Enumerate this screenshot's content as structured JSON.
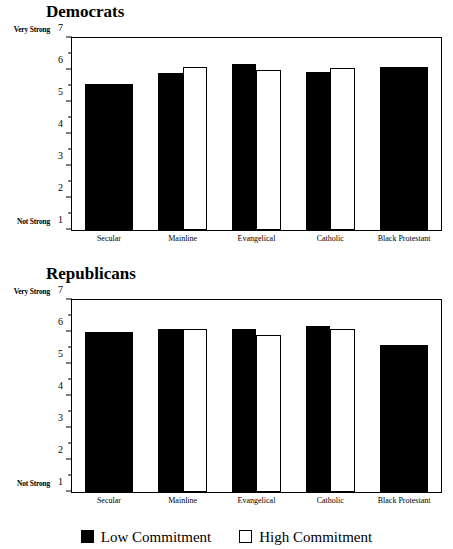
{
  "figure": {
    "axis_min": 1,
    "axis_max": 7,
    "y_axis_label": "Strength of Party Support",
    "y_low_anchor": "Not Strong",
    "y_high_anchor": "Very Strong",
    "tick_labels": [
      "7",
      "6",
      "5",
      "4",
      "3",
      "2",
      "1"
    ],
    "tick_values": [
      7,
      6,
      5,
      4,
      3,
      2,
      1
    ],
    "minor_tick_values": [
      6.5,
      5.5,
      4.5,
      3.5,
      2.5,
      1.5
    ],
    "categories": [
      "Secular",
      "Mainline",
      "Evangelical",
      "Catholic",
      "Black Protestant"
    ],
    "series_names": [
      "Low Commitment",
      "High Commitment"
    ],
    "colors": {
      "low_commitment": "#000000",
      "high_commitment": "#ffffff",
      "outline": "#000000",
      "background": "#ffffff"
    }
  },
  "legend": {
    "items": [
      {
        "label": "Low Commitment",
        "swatch": "filled-square-icon"
      },
      {
        "label": "High Commitment",
        "swatch": "hollow-square-icon"
      }
    ]
  },
  "panels": [
    {
      "id": "democrats",
      "title": "Democrats"
    },
    {
      "id": "republicans",
      "title": "Republicans"
    }
  ],
  "chart_data": [
    {
      "type": "bar",
      "title": "Democrats",
      "xlabel": "",
      "ylabel": "Strength of Party Support",
      "ylim": [
        1,
        7
      ],
      "yticks": [
        1,
        2,
        3,
        4,
        5,
        6,
        7
      ],
      "ytick_anchors": {
        "1": "Not Strong",
        "7": "Very Strong"
      },
      "grid": false,
      "legend_position": "bottom-outside-figure",
      "categories": [
        "Secular",
        "Mainline",
        "Evangelical",
        "Catholic",
        "Black Protestant"
      ],
      "series": [
        {
          "name": "Low Commitment",
          "values": [
            5.55,
            5.9,
            6.2,
            5.95,
            6.1
          ]
        },
        {
          "name": "High Commitment",
          "values": [
            null,
            6.1,
            6.0,
            6.05,
            null
          ]
        }
      ]
    },
    {
      "type": "bar",
      "title": "Republicans",
      "xlabel": "",
      "ylabel": "Strength of Party Support",
      "ylim": [
        1,
        7
      ],
      "yticks": [
        1,
        2,
        3,
        4,
        5,
        6,
        7
      ],
      "ytick_anchors": {
        "1": "Not Strong",
        "7": "Very Strong"
      },
      "grid": false,
      "legend_position": "bottom-outside-figure",
      "categories": [
        "Secular",
        "Mainline",
        "Evangelical",
        "Catholic",
        "Black Protestant"
      ],
      "series": [
        {
          "name": "Low Commitment",
          "values": [
            6.0,
            6.1,
            6.1,
            6.2,
            5.6
          ]
        },
        {
          "name": "High Commitment",
          "values": [
            null,
            6.1,
            5.9,
            6.1,
            null
          ]
        }
      ]
    }
  ]
}
